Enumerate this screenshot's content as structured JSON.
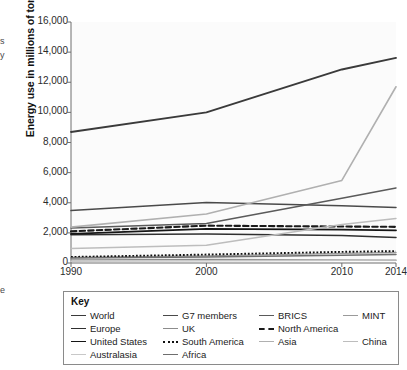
{
  "edge_fragments": {
    "a": "s",
    "b": "y",
    "c": "e"
  },
  "chart": {
    "y_axis_title": "Energy use in millions of tons",
    "legend_title": "Key"
  },
  "chart_data": {
    "type": "line",
    "title": "",
    "xlabel": "",
    "ylabel": "Energy use in millions of tons",
    "x": [
      1990,
      2000,
      2010,
      2014
    ],
    "xticks": [
      "1990",
      "2000",
      "2010",
      "2014"
    ],
    "xlim": [
      1990,
      2014
    ],
    "ylim": [
      0,
      16000
    ],
    "yticks": [
      0,
      2000,
      4000,
      6000,
      8000,
      10000,
      12000,
      14000,
      16000
    ],
    "ytick_labels": [
      "0",
      "2,000",
      "4,000",
      "6,000",
      "8,000",
      "10,000",
      "12,000",
      "14,000",
      "16,000"
    ],
    "grid": false,
    "legend_position": "below",
    "series": [
      {
        "name": "World",
        "values": [
          8700,
          10000,
          12850,
          13620
        ],
        "color": "#3a3a3a",
        "width": 1.9,
        "dash": "none"
      },
      {
        "name": "G7 members",
        "values": [
          3480,
          4020,
          3800,
          3680
        ],
        "color": "#4a4a4a",
        "width": 1.5,
        "dash": "none"
      },
      {
        "name": "BRICS",
        "values": [
          2320,
          2620,
          4300,
          4980
        ],
        "color": "#5a5a5a",
        "width": 1.5,
        "dash": "none"
      },
      {
        "name": "MINT",
        "values": [
          370,
          470,
          640,
          700
        ],
        "color": "#9a9a9a",
        "width": 1.4,
        "dash": "none"
      },
      {
        "name": "Europe",
        "values": [
          1880,
          1930,
          1820,
          1700
        ],
        "color": "#2f2f2f",
        "width": 1.5,
        "dash": "none"
      },
      {
        "name": "UK",
        "values": [
          210,
          230,
          200,
          180
        ],
        "color": "#8c8c8c",
        "width": 1.4,
        "dash": "none"
      },
      {
        "name": "North America",
        "values": [
          2100,
          2480,
          2420,
          2400
        ],
        "color": "#1a1a1a",
        "width": 2.1,
        "dash": "dashed"
      },
      {
        "name": "United States",
        "values": [
          1930,
          2270,
          2210,
          2170
        ],
        "color": "#151515",
        "width": 1.8,
        "dash": "none"
      },
      {
        "name": "South America",
        "values": [
          400,
          560,
          740,
          790
        ],
        "color": "#111111",
        "width": 1.9,
        "dash": "dotted"
      },
      {
        "name": "Asia",
        "values": [
          2380,
          3250,
          5480,
          11700
        ],
        "color": "#b0b0b0",
        "width": 1.6,
        "dash": "none"
      },
      {
        "name": "China",
        "values": [
          960,
          1180,
          2550,
          2960
        ],
        "color": "#bdbdbd",
        "width": 1.5,
        "dash": "none"
      },
      {
        "name": "Australasia",
        "values": [
          120,
          150,
          180,
          190
        ],
        "color": "#c8c8c8",
        "width": 1.4,
        "dash": "none"
      },
      {
        "name": "Africa",
        "values": [
          330,
          400,
          520,
          560
        ],
        "color": "#6e6e6e",
        "width": 1.5,
        "dash": "none"
      }
    ]
  },
  "legend": {
    "rows": [
      [
        {
          "label": "World",
          "color": "#3a3a3a",
          "dash": "none"
        },
        {
          "label": "G7 members",
          "color": "#4a4a4a",
          "dash": "none"
        },
        {
          "label": "BRICS",
          "color": "#5a5a5a",
          "dash": "none"
        },
        {
          "label": "MINT",
          "color": "#9a9a9a",
          "dash": "none"
        }
      ],
      [
        {
          "label": "Europe",
          "color": "#2f2f2f",
          "dash": "none"
        },
        {
          "label": "UK",
          "color": "#8c8c8c",
          "dash": "none"
        },
        {
          "label": "North America",
          "color": "#1a1a1a",
          "dash": "dashed"
        }
      ],
      [
        {
          "label": "United States",
          "color": "#151515",
          "dash": "none"
        },
        {
          "label": "South America",
          "color": "#111111",
          "dash": "dotted"
        },
        {
          "label": "Asia",
          "color": "#b0b0b0",
          "dash": "none"
        },
        {
          "label": "China",
          "color": "#bdbdbd",
          "dash": "none"
        }
      ],
      [
        {
          "label": "Australasia",
          "color": "#c8c8c8",
          "dash": "none"
        },
        {
          "label": "Africa",
          "color": "#6e6e6e",
          "dash": "none"
        }
      ]
    ]
  }
}
